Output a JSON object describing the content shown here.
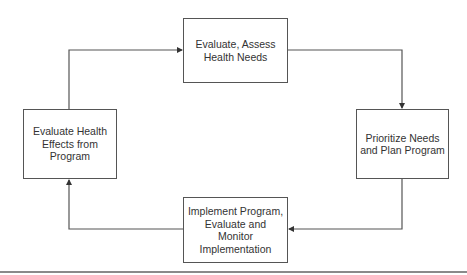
{
  "diagram": {
    "type": "cycle",
    "nodes": [
      {
        "id": "top",
        "label": "Evaluate, Assess\nHealth Needs"
      },
      {
        "id": "right",
        "label": "Prioritize Needs\nand Plan Program"
      },
      {
        "id": "bottom",
        "label": "Implement Program,\nEvaluate and Monitor\nImplementation"
      },
      {
        "id": "left",
        "label": "Evaluate Health\nEffects from\nProgram"
      }
    ],
    "edges": [
      {
        "from": "top",
        "to": "right"
      },
      {
        "from": "right",
        "to": "bottom"
      },
      {
        "from": "bottom",
        "to": "left"
      },
      {
        "from": "left",
        "to": "top"
      }
    ],
    "colors": {
      "line": "#555555",
      "text": "#333333",
      "rule": "#8a8a8a"
    }
  }
}
